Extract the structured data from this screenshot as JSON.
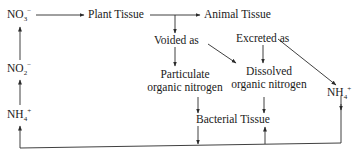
{
  "diagram": {
    "type": "nitrogen-cycle-flow",
    "nodes": {
      "no3": {
        "base": "NO",
        "sub": "3",
        "sup": "−"
      },
      "no2": {
        "base": "NO",
        "sub": "2",
        "sup": "−"
      },
      "nh4_left": {
        "base": "NH",
        "sub": "4",
        "sup": "+"
      },
      "nh4_right": {
        "base": "NH",
        "sub": "4",
        "sup": "+"
      },
      "plant_tissue": "Plant Tissue",
      "animal_tissue": "Animal Tissue",
      "voided_as": "Voided as",
      "excreted_as": "Excreted as",
      "particulate_line1": "Particulate",
      "particulate_line2": "organic nitrogen",
      "dissolved_line1": "Dissolved",
      "dissolved_line2": "organic nitrogen",
      "bacterial_tissue": "Bacterial Tissue"
    },
    "edges": [
      {
        "from": "NO3-",
        "to": "Plant Tissue"
      },
      {
        "from": "Plant Tissue",
        "to": "Animal Tissue"
      },
      {
        "from": "Plant Tissue",
        "to": "Voided as"
      },
      {
        "from": "Voided as",
        "to": "Particulate organic nitrogen"
      },
      {
        "from": "Voided as",
        "to": "Dissolved organic nitrogen"
      },
      {
        "from": "Excreted as",
        "to": "Dissolved organic nitrogen"
      },
      {
        "from": "Excreted as",
        "to": "NH4+ (right)"
      },
      {
        "from": "Particulate organic nitrogen",
        "to": "Bacterial Tissue"
      },
      {
        "from": "Dissolved organic nitrogen",
        "to": "Bacterial Tissue"
      },
      {
        "from": "Bacterial Tissue",
        "to": "bottom return line"
      },
      {
        "from": "bottom return line",
        "to": "Bacterial Tissue"
      },
      {
        "from": "NH4+ (right)",
        "to": "bottom return line"
      },
      {
        "from": "bottom return line",
        "to": "NH4+ (left)"
      },
      {
        "from": "NH4+ (left)",
        "to": "NO2-"
      },
      {
        "from": "NO2-",
        "to": "NO3-"
      }
    ],
    "line_color": "#2a2a2a"
  }
}
